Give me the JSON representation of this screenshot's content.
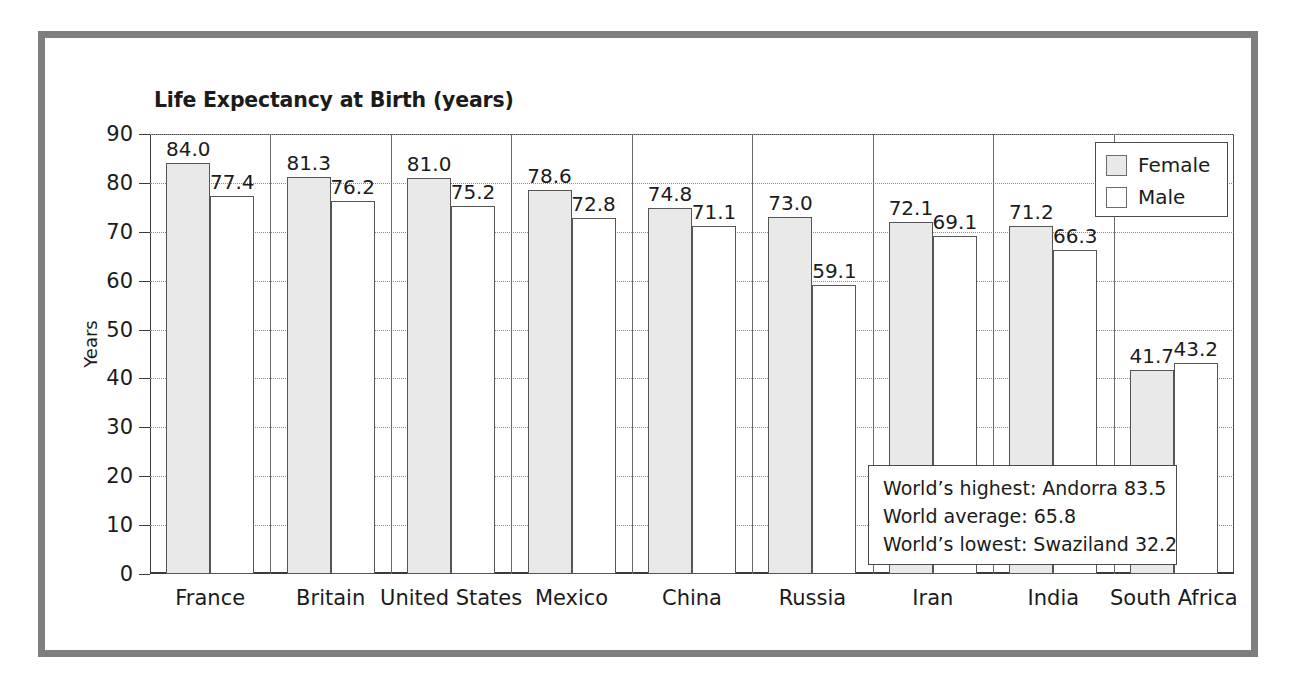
{
  "chart_data": {
    "type": "bar",
    "title": "Life Expectancy at Birth (years)",
    "xlabel": "",
    "ylabel": "Years",
    "ylim": [
      0,
      90
    ],
    "ytick_step": 10,
    "yticks": [
      "90",
      "80",
      "70",
      "60",
      "50",
      "40",
      "30",
      "20",
      "10",
      "0"
    ],
    "grid": "horizontal-dotted",
    "legend_position": "top-right",
    "categories": [
      "France",
      "Britain",
      "United States",
      "Mexico",
      "China",
      "Russia",
      "Iran",
      "India",
      "South Africa"
    ],
    "series": [
      {
        "name": "Female",
        "color": "#e9e9e9",
        "values": [
          84.0,
          81.3,
          81.0,
          78.6,
          74.8,
          73.0,
          72.1,
          71.2,
          41.7
        ],
        "labels": [
          "84.0",
          "81.3",
          "81.0",
          "78.6",
          "74.8",
          "73.0",
          "72.1",
          "71.2",
          "41.7"
        ]
      },
      {
        "name": "Male",
        "color": "#ffffff",
        "values": [
          77.4,
          76.2,
          75.2,
          72.8,
          71.1,
          59.1,
          69.1,
          66.3,
          43.2
        ],
        "labels": [
          "77.4",
          "76.2",
          "75.2",
          "72.8",
          "71.1",
          "59.1",
          "69.1",
          "66.3",
          "43.2"
        ]
      }
    ],
    "annotations": [
      "World’s highest: Andorra 83.5",
      "World average: 65.8",
      "World’s lowest: Swaziland 32.2"
    ]
  },
  "legend": {
    "items": [
      {
        "label": "Female",
        "swatch": "female"
      },
      {
        "label": "Male",
        "swatch": "male"
      }
    ]
  },
  "colors": {
    "frame": "#7e7e7e",
    "axis": "#3a3a3a",
    "grid": "#8b8b8b",
    "bar_border": "#555555",
    "female_fill": "#e9e9e9",
    "male_fill": "#ffffff",
    "text": "#1b1b1b"
  }
}
